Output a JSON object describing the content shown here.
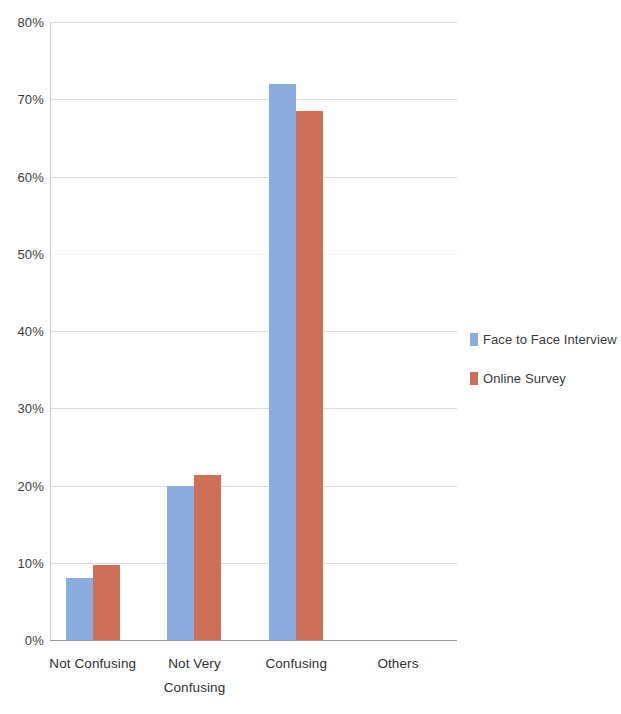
{
  "chart_data": {
    "type": "bar",
    "title": "",
    "subtitle": "",
    "xlabel": "",
    "ylabel": "",
    "categories": [
      "Not Confusing",
      "Not Very Confusing",
      "Confusing",
      "Others"
    ],
    "category_lines": [
      [
        "Not Confusing"
      ],
      [
        "Not Very",
        "Confusing"
      ],
      [
        "Confusing"
      ],
      [
        "Others"
      ]
    ],
    "series": [
      {
        "name": "Face to Face Interview",
        "color": "#8cabdf",
        "values": [
          8,
          20,
          72,
          0
        ]
      },
      {
        "name": "Online Survey",
        "color": "#ce7058",
        "values": [
          9.7,
          21.3,
          68.5,
          0
        ]
      }
    ],
    "ylim": [
      0,
      80
    ],
    "ytick_values": [
      0,
      10,
      20,
      30,
      40,
      50,
      60,
      70,
      80
    ],
    "ytick_labels": [
      "0%",
      "10%",
      "20%",
      "30%",
      "40%",
      "50%",
      "60%",
      "70%",
      "80%"
    ],
    "value_format": "percent",
    "grid": true,
    "grid_axis": "y",
    "legend_position": "right",
    "bar_group_gap": true
  },
  "legend": {
    "entries": [
      {
        "label": "Face to Face Interview",
        "swatch": "#8cabdf"
      },
      {
        "label": "Online Survey",
        "swatch": "#ce7058"
      }
    ]
  }
}
